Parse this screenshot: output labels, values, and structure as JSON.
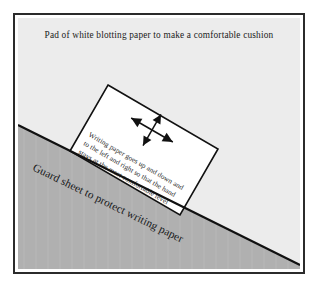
{
  "figure": {
    "colors": {
      "page_background": "#ffffff",
      "frame_border": "#2b2b2b",
      "blotting_pad": "#ececec",
      "guard_sheet": "#b0b0b0",
      "guard_sheet_edge": "#111111",
      "writing_paper": "#ffffff",
      "writing_paper_outline": "#111111",
      "text": "#1a1a1a"
    }
  },
  "pad": {
    "caption": "Pad of white blotting paper to make a comfortable cushion"
  },
  "guard_sheet": {
    "label": "Guard sheet to protect writing paper"
  },
  "writing_paper": {
    "caption_lines": [
      "Writing paper goes up and down and",
      "to the left and right so that the hand",
      "stays at the most comfortable level"
    ],
    "arrow": {
      "name": "four-way-move-arrow",
      "directions": [
        "up",
        "down",
        "left",
        "right"
      ]
    }
  }
}
